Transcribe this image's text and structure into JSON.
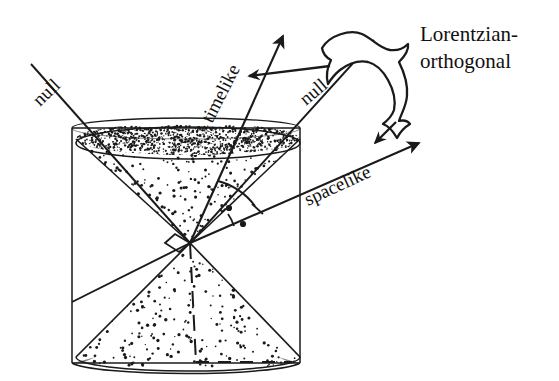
{
  "figure": {
    "background_color": "#ffffff",
    "ink_color": "#1a1a1a",
    "width": 559,
    "height": 381
  },
  "labels": {
    "null_left": "null",
    "null_right": "null",
    "timelike": "timelike",
    "spacelike": "spacelike",
    "annotation_line1": "Lorentzian-",
    "annotation_line2": "orthogonal"
  },
  "diagram": {
    "cylinder": {
      "left_x": 72,
      "right_x": 300,
      "top_y": 128,
      "bottom_y": 363,
      "ellipse_ry": 11
    },
    "cone_apex": {
      "x": 190,
      "y": 243
    },
    "upper_cone_rim": {
      "cx": 188,
      "cy": 144,
      "rx": 112,
      "ry": 16
    },
    "lower_cone_rim": {
      "cx": 188,
      "cy": 360,
      "rx": 112,
      "ry": 14
    },
    "vectors": [
      {
        "name": "timelike",
        "from_x": 190,
        "from_y": 243,
        "to_x": 287,
        "to_y": 27,
        "rotation_deg": -66
      },
      {
        "name": "spacelike",
        "from_x": 190,
        "from_y": 243,
        "to_x": 427,
        "to_y": 140,
        "rotation_deg": -24
      },
      {
        "name": "null_left",
        "from_x": 190,
        "from_y": 243,
        "to_x": 30,
        "to_y": 63,
        "rotation_deg": -45
      },
      {
        "name": "null_right",
        "from_x": 190,
        "from_y": 243,
        "to_x": 372,
        "to_y": 41,
        "rotation_deg": -38
      }
    ],
    "angle_markers": [
      {
        "name": "right-angle-marker",
        "x": 175,
        "y": 242
      },
      {
        "name": "equal-angle-arc-outer",
        "dot": true
      },
      {
        "name": "equal-angle-arc-inner",
        "dot": true
      }
    ],
    "stipple_seed": 20240,
    "dashed_baseline": {
      "x1": 196,
      "x2": 290,
      "y": 362
    }
  }
}
